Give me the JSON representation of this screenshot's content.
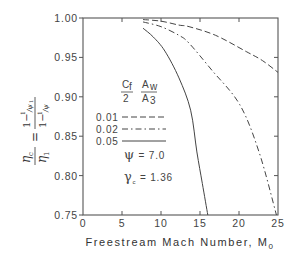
{
  "chart_data": {
    "type": "line",
    "title": "",
    "xlabel": "Freestream Mach Number, M",
    "xlabel_subscript": "0",
    "ylabel": "η_c / η_1 = (1 − 1/ψ_1) / (1 − 1/ψ)",
    "xlim": [
      0,
      25
    ],
    "ylim": [
      0.75,
      1.0
    ],
    "xticks": [
      0,
      5,
      10,
      15,
      20,
      25
    ],
    "xtick_labels": [
      "0",
      "5",
      "10",
      "15",
      "20",
      "25"
    ],
    "yticks": [
      0.75,
      0.8,
      0.85,
      0.9,
      0.95,
      1.0
    ],
    "ytick_labels": [
      "0.75",
      "0.80",
      "0.85",
      "0.90",
      "0.95",
      "1.00"
    ],
    "grid": false,
    "legend_title": {
      "left_num": "C",
      "left_sub": "f",
      "left_den": "2",
      "right_num": "A",
      "right_sub": "w",
      "right_den": "A",
      "right_den_sub": "3"
    },
    "series": [
      {
        "name": "0.01",
        "style": "dashed",
        "points": [
          [
            7.7,
            0.998
          ],
          [
            10,
            0.996
          ],
          [
            12.3,
            0.991
          ],
          [
            13.6,
            0.989
          ],
          [
            17,
            0.978
          ],
          [
            21,
            0.957
          ],
          [
            23,
            0.946
          ],
          [
            25,
            0.931
          ]
        ]
      },
      {
        "name": "0.02",
        "style": "dashdot",
        "points": [
          [
            7.7,
            0.995
          ],
          [
            10,
            0.989
          ],
          [
            12.3,
            0.978
          ],
          [
            13.6,
            0.968
          ],
          [
            16.5,
            0.934
          ],
          [
            20.1,
            0.89
          ],
          [
            22.6,
            0.829
          ],
          [
            24.8,
            0.75
          ]
        ]
      },
      {
        "name": "0.05",
        "style": "solid",
        "points": [
          [
            7.7,
            0.987
          ],
          [
            9,
            0.976
          ],
          [
            10.5,
            0.958
          ],
          [
            12.3,
            0.924
          ],
          [
            13.8,
            0.883
          ],
          [
            14.6,
            0.83
          ],
          [
            15.3,
            0.79
          ],
          [
            16.0,
            0.75
          ]
        ]
      }
    ],
    "annotations": [
      {
        "symbol": "ψ",
        "sub": "",
        "text": " = 7.0"
      },
      {
        "symbol": "γ",
        "sub": "c",
        "text": " = 1.36"
      }
    ]
  }
}
